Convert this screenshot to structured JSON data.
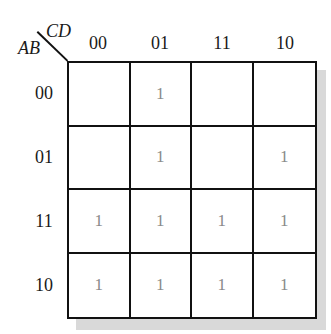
{
  "kmap": {
    "row_variable": "AB",
    "col_variable": "CD",
    "col_headers": [
      "00",
      "01",
      "11",
      "10"
    ],
    "row_headers": [
      "00",
      "01",
      "11",
      "10"
    ],
    "cells": [
      [
        "",
        "1",
        "",
        ""
      ],
      [
        "",
        "1",
        "",
        "1"
      ],
      [
        "1",
        "1",
        "1",
        "1"
      ],
      [
        "1",
        "1",
        "1",
        "1"
      ]
    ]
  }
}
